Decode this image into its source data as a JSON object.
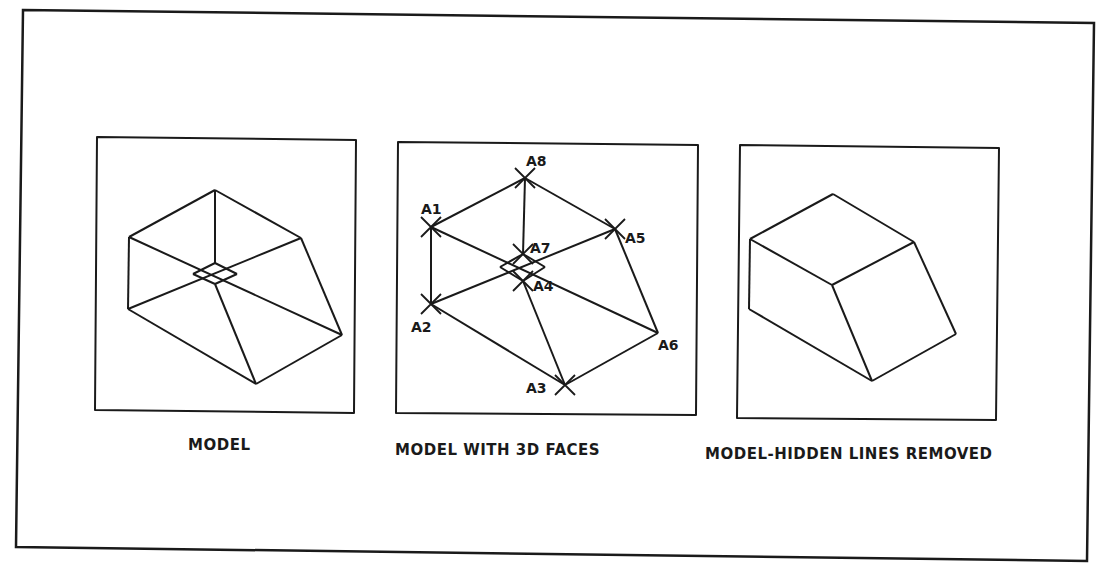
{
  "figure": {
    "panels": [
      {
        "id": "model",
        "caption": "MODEL"
      },
      {
        "id": "model-3d-faces",
        "caption": "MODEL WITH 3D FACES",
        "vertex_labels": {
          "a1": "A1",
          "a2": "A2",
          "a3": "A3",
          "a4": "A4",
          "a5": "A5",
          "a6": "A6",
          "a7": "A7",
          "a8": "A8"
        }
      },
      {
        "id": "model-hidden-lines-removed",
        "caption": "MODEL-HIDDEN LINES REMOVED"
      }
    ]
  },
  "colors": {
    "ink": "#1a1a1a",
    "paper": "#ffffff"
  }
}
